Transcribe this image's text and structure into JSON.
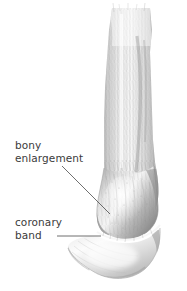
{
  "figure": {
    "background_color": "#ffffff",
    "width": 187,
    "height": 291
  },
  "labels": {
    "bony_enlargement": "bony\nenlargement",
    "coronary_band": "coronary\nband"
  },
  "colors": {
    "text": "#3b3b3b",
    "leader_line": "#4a4a4a",
    "hoof_light": "#dcdcdc",
    "hoof_mid": "#b6b6b6",
    "pastern_dark": "#8e8e8e",
    "leg_shade": "#b9b9b9",
    "coronary_highlight": "#fcfcfc"
  },
  "leaders": [
    {
      "name": "bony-enlargement-leader",
      "type": "diagonal",
      "from": [
        62,
        166
      ],
      "to": [
        110,
        214
      ]
    },
    {
      "name": "coronary-band-leader",
      "type": "horizontal",
      "from": [
        57,
        236
      ],
      "to": [
        101,
        236
      ]
    }
  ],
  "anatomy": {
    "regions": [
      "cannon",
      "fetlock",
      "pastern",
      "coronary-band",
      "hoof-wall"
    ]
  }
}
